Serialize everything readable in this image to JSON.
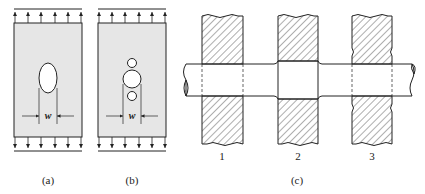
{
  "figure": {
    "panels": [
      {
        "id": "a",
        "caption": "(a)",
        "description": "Plate under tension with single elliptical hole",
        "dimension_label": "w"
      },
      {
        "id": "b",
        "caption": "(b)",
        "description": "Plate under tension with large hole flanked by two small holes",
        "dimension_label": "w"
      },
      {
        "id": "c",
        "caption": "(c)",
        "description": "Shaft passing through hub/blocks with varying fits",
        "blocks": [
          {
            "label": "1"
          },
          {
            "label": "2"
          },
          {
            "label": "3"
          }
        ]
      }
    ],
    "colors": {
      "line": "#222222",
      "plate_fill": "#e6e6e6",
      "hatch": "#333333",
      "background": "#ffffff"
    }
  }
}
